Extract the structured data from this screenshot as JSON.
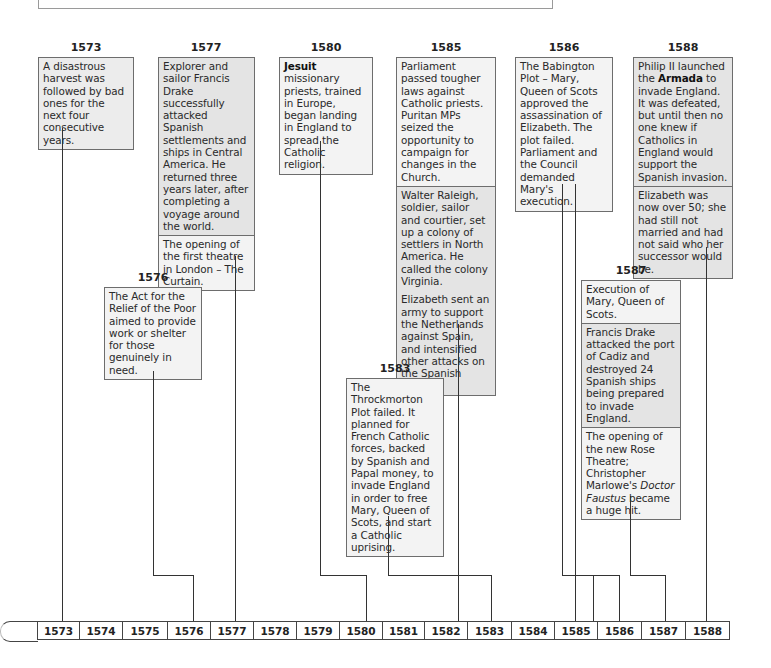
{
  "events": [
    {
      "year": "1573",
      "entries": [
        {
          "html": "A disastrous harvest was followed by bad ones for the next four consecutive years."
        }
      ]
    },
    {
      "year": "1576",
      "entries": [
        {
          "html": "The Act for the Relief of the Poor aimed to provide work or shelter for those genuinely in need."
        }
      ]
    },
    {
      "year": "1577",
      "entries": [
        {
          "html": "Explorer and sailor Francis Drake successfully attacked Spanish settlements and ships in Central America. He returned three years later, after completing a voyage around the world."
        },
        {
          "html": "The opening of the first theatre in London – The Curtain."
        }
      ]
    },
    {
      "year": "1580",
      "entries": [
        {
          "html": "<b>Jesuit</b> missionary priests, trained in Europe, began landing in England to spread the Catholic religion."
        }
      ]
    },
    {
      "year": "1583",
      "entries": [
        {
          "html": "The Throckmorton Plot failed. It planned for French Catholic forces, backed by Spanish and Papal money, to invade England in order to free Mary, Queen of Scots, and start a Catholic uprising."
        }
      ]
    },
    {
      "year": "1585",
      "entries": [
        {
          "html": "Parliament passed tougher laws against Catholic priests. Puritan MPs seized the opportunity to campaign for changes in the Church."
        },
        {
          "html": "Walter Raleigh, soldier, sailor and courtier, set up a colony of settlers in North America. He called the colony Virginia."
        },
        {
          "html": "Elizabeth sent an army to support the Netherlands against Spain, and intensified other attacks on the Spanish Empire."
        }
      ]
    },
    {
      "year": "1586",
      "entries": [
        {
          "html": "The Babington Plot – Mary, Queen of Scots approved the assassination of Elizabeth. The plot failed. Parliament and the Council demanded Mary's execution."
        }
      ]
    },
    {
      "year": "1587",
      "entries": [
        {
          "html": "Execution of Mary, Queen of Scots."
        },
        {
          "html": "Francis Drake attacked the port of Cadiz and destroyed 24 Spanish ships being prepared to invade England."
        },
        {
          "html": "The opening of the new Rose Theatre; Christopher Marlowe's <i>Doctor Faustus</i> became a huge hit."
        }
      ]
    },
    {
      "year": "1588",
      "entries": [
        {
          "html": "Philip II launched the <b>Armada</b> to invade England. It was defeated, but until then no one knew if Catholics in England would support the Spanish invasion."
        },
        {
          "html": "Elizabeth was now over 50; she had still not married and had not said who her successor would be."
        }
      ]
    }
  ],
  "timeline": {
    "years": [
      "1573",
      "1574",
      "1575",
      "1576",
      "1577",
      "1578",
      "1579",
      "1580",
      "1581",
      "1582",
      "1583",
      "1584",
      "1585",
      "1586",
      "1587",
      "1588"
    ]
  },
  "colors": {
    "box_fill": "#ececec",
    "box_fill_light": "#f3f3f3",
    "border": "#6d6d6d",
    "line": "#333333"
  }
}
